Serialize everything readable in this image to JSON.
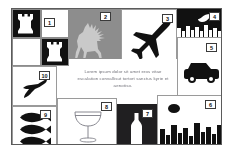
{
  "board": {
    "title": "Silhouette icon collage board",
    "background_color": "#ffffff",
    "frame_color": "#5b5b5b",
    "panel_line_color": "#9a9a9a",
    "ink_color": "#111111",
    "deer_panel_color": "#8d8d8d",
    "night_panel_color": "#111111",
    "bottle_panel_color": "#201f21"
  },
  "body_text": {
    "paragraph": "Lorem ipsum dolor sit amet eros vitae escalation convallisut tortort sanctus kyrie et aenotiso.",
    "color": "#6e6e76"
  },
  "panels": [
    {
      "number": "1",
      "name": "chess-rooks",
      "icon": "chess-rook-icon",
      "caption": "Chess rooks on checkerboard",
      "background": "#ffffff"
    },
    {
      "number": "2",
      "name": "deer",
      "icon": "deer-icon",
      "caption": "Deer silhouette",
      "background": "#8d8d8d"
    },
    {
      "number": "3",
      "name": "airplane",
      "icon": "airplane-icon",
      "caption": "Airplane silhouette",
      "background": "#ffffff"
    },
    {
      "number": "4",
      "name": "night-skyline",
      "icon": "crescent-moon-icon",
      "caption": "Crescent moon over inverted skyline",
      "background": "#111111"
    },
    {
      "number": "5",
      "name": "car",
      "icon": "car-icon",
      "caption": "Car silhouette",
      "background": "#ffffff"
    },
    {
      "number": "6",
      "name": "day-skyline",
      "icon": "city-skyline-icon",
      "caption": "City skyline with sun",
      "background": "#ffffff"
    },
    {
      "number": "7",
      "name": "bottle",
      "icon": "bottle-icon",
      "caption": "Bottle silhouette",
      "background": "#201f21"
    },
    {
      "number": "8",
      "name": "cocktail-glass",
      "icon": "cocktail-glass-icon",
      "caption": "Cocktail glass outline",
      "background": "#ffffff"
    },
    {
      "number": "9",
      "name": "fish",
      "icon": "fish-icon",
      "caption": "Three fish silhouettes",
      "background": "#ffffff"
    },
    {
      "number": "10",
      "name": "flying-bird",
      "icon": "flying-bird-icon",
      "caption": "Flying bird silhouette",
      "background": "#ffffff"
    }
  ]
}
